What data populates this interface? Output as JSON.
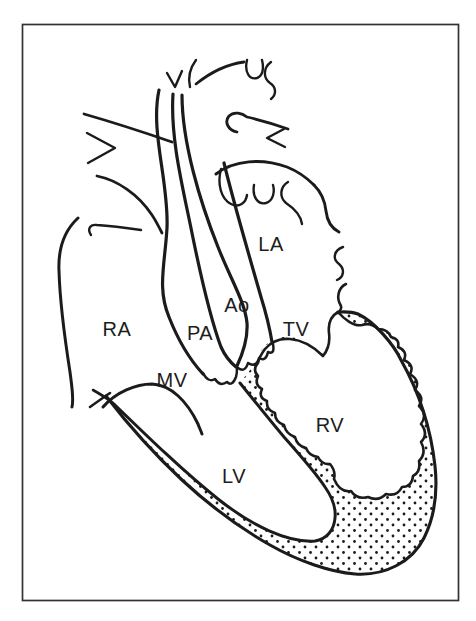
{
  "figure": {
    "type": "heart-anatomy-line-drawing",
    "ink_color": "#1b1b1b",
    "background_color": "#ffffff",
    "labels": {
      "ra": "RA",
      "pa": "PA",
      "ao": "Ao",
      "la": "LA",
      "tv": "TV",
      "mv": "MV",
      "rv": "RV",
      "lv": "LV"
    }
  }
}
